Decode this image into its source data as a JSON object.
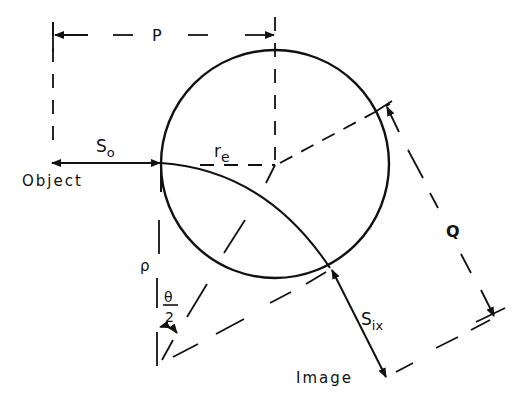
{
  "diagram": {
    "type": "optics-geometry",
    "labels": {
      "P": "P",
      "Q": "Q",
      "So_main": "S",
      "So_sub": "o",
      "re_main": "r",
      "re_sub": "e",
      "rho": "ρ",
      "theta": "θ",
      "two": "2",
      "Six_main": "S",
      "Six_sub": "ix",
      "object": "Object",
      "image": "Image"
    },
    "colors": {
      "stroke": "#111111",
      "background": "#ffffff"
    }
  }
}
